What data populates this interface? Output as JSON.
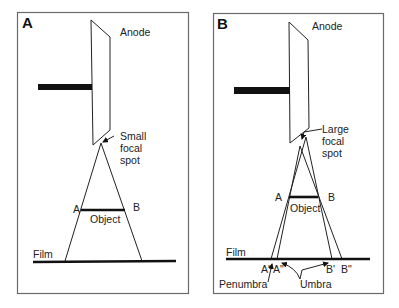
{
  "figure": {
    "panels": [
      {
        "letter": "A",
        "labels": {
          "anode": "Anode",
          "focal_spot_line1": "Small",
          "focal_spot_line2": "focal",
          "focal_spot_line3": "spot",
          "point_a": "A",
          "point_b": "B",
          "object": "Object",
          "film": "Film"
        }
      },
      {
        "letter": "B",
        "labels": {
          "anode": "Anode",
          "focal_spot_line1": "Large",
          "focal_spot_line2": "focal",
          "focal_spot_line3": "spot",
          "point_a": "A",
          "point_b": "B",
          "object": "Object",
          "film": "Film",
          "a_prime": "A'",
          "a_double_prime": "A\"",
          "b_prime": "B'",
          "b_double_prime": "B\"",
          "penumbra": "Penumbra",
          "umbra": "Umbra"
        }
      }
    ],
    "colors": {
      "line": "#111111",
      "border": "#6a6a6a",
      "background": "#ffffff"
    }
  }
}
